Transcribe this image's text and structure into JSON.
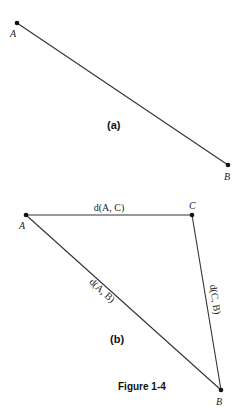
{
  "figure": {
    "caption": "Figure 1-4",
    "part_a": {
      "label": "(a)",
      "points": [
        {
          "name": "A"
        },
        {
          "name": "B"
        }
      ]
    },
    "part_b": {
      "label": "(b)",
      "points": [
        {
          "name": "A"
        },
        {
          "name": "C"
        },
        {
          "name": "B"
        }
      ],
      "edges": [
        {
          "from": "A",
          "to": "C",
          "label": "d(A, C)"
        },
        {
          "from": "A",
          "to": "B",
          "label": "d(A, B)"
        },
        {
          "from": "C",
          "to": "B",
          "label": "d(C, B)"
        }
      ]
    }
  }
}
